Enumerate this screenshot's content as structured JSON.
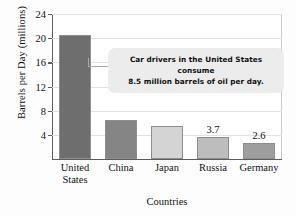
{
  "chart_data": {
    "type": "bar",
    "title": "",
    "xlabel": "Countries",
    "ylabel": "Barrels per Day (millions)",
    "categories": [
      "United States",
      "China",
      "Japan",
      "Russia",
      "Germany"
    ],
    "category_lines": [
      [
        "United",
        "States"
      ],
      [
        "China"
      ],
      [
        "Japan"
      ],
      [
        "Russia"
      ],
      [
        "Germany"
      ]
    ],
    "values": [
      20.6,
      6.4,
      5.4,
      3.7,
      2.6
    ],
    "bar_labels": [
      "",
      "",
      "",
      "3.7",
      "2.6"
    ],
    "bar_colors": [
      "#6e6e6e",
      "#858585",
      "#d4d4d4",
      "#bdbdbd",
      "#9e9e9e"
    ],
    "ylim": [
      0,
      24
    ],
    "yticks": [
      4,
      8,
      12,
      16,
      20,
      24
    ],
    "ytick_labels": [
      "4",
      "8",
      "12",
      "16",
      "20",
      "24"
    ],
    "grid": true,
    "legend": "none"
  },
  "annotation": {
    "name": "callout",
    "line1": "Car drivers in the United States consume",
    "line2": "8.5 million barrels of oil per day.",
    "points_to": "United States"
  }
}
